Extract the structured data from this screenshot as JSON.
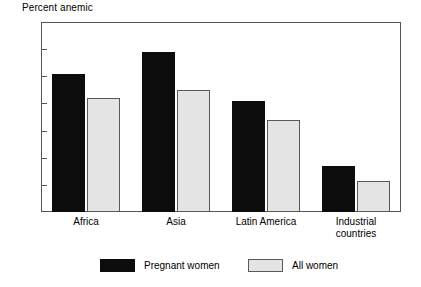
{
  "chart_data": {
    "type": "bar",
    "title": "Percent anemic",
    "xlabel": "",
    "ylabel": "",
    "ylim": [
      0,
      70
    ],
    "yticks": [
      0,
      10,
      20,
      30,
      40,
      50,
      60,
      70
    ],
    "grid": false,
    "legend_position": "bottom-center",
    "categories": [
      "Africa",
      "Asia",
      "Latin America",
      "Industrial\ncountries"
    ],
    "category_labels_flat": [
      "Africa",
      "Asia",
      "Latin America",
      "Industrial countries"
    ],
    "series": [
      {
        "name": "Pregnant women",
        "color": "#0d0d0d",
        "values": [
          51,
          59,
          41,
          17
        ]
      },
      {
        "name": "All women",
        "color": "#e4e4e4",
        "values": [
          42,
          45,
          34,
          11.5
        ]
      }
    ]
  },
  "colors": {
    "pregnant": "#0d0d0d",
    "all_women": "#e4e4e4",
    "axis": "#555555",
    "background": "#ffffff"
  },
  "legend": {
    "items": [
      {
        "label": "Pregnant women"
      },
      {
        "label": "All women"
      }
    ]
  }
}
